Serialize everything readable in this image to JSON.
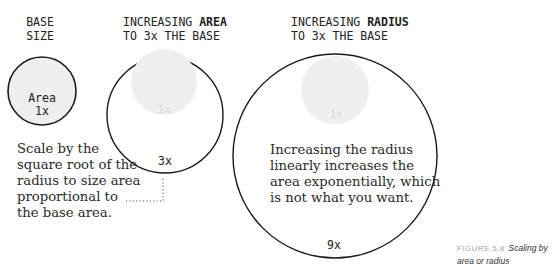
{
  "figure": {
    "columns": [
      {
        "id": "base",
        "heading_lines": [
          {
            "text": "BASE",
            "bold": ""
          },
          {
            "text": "SIZE",
            "bold": ""
          }
        ],
        "circle_label_line1": "Area",
        "circle_label_line2": "1x",
        "relative_area": 1,
        "relative_radius": 1
      },
      {
        "id": "area",
        "heading_line1_plain": "INCREASING ",
        "heading_line1_bold": "AREA",
        "heading_line2": "TO 3x THE BASE",
        "ghost_label": "1x",
        "multiplier_label": "3x",
        "relative_area": 3,
        "relative_radius": 1.732,
        "note_lines": [
          "Scale by the",
          "square root of the",
          "radius to size area",
          "proportional to",
          "the base area."
        ]
      },
      {
        "id": "radius",
        "heading_line1_plain": "INCREASING ",
        "heading_line1_bold": "RADIUS",
        "heading_line2": "TO 3x THE BASE",
        "ghost_label": "1x",
        "multiplier_label": "9x",
        "relative_area": 9,
        "relative_radius": 3,
        "note_lines": [
          "Increasing the radius",
          "linearly increases the",
          "area exponentially, which",
          "is not what you want."
        ]
      }
    ],
    "caption": {
      "number": "FIGURE 5.8",
      "title_line1": "Scaling by",
      "title_line2": "area or radius"
    },
    "colors": {
      "outline": "#1a1a1a",
      "base_fill": "#eeeeee",
      "ghost_fill": "#efefef",
      "ghost_text": "#d8d8d8",
      "leader": "#555555"
    }
  }
}
